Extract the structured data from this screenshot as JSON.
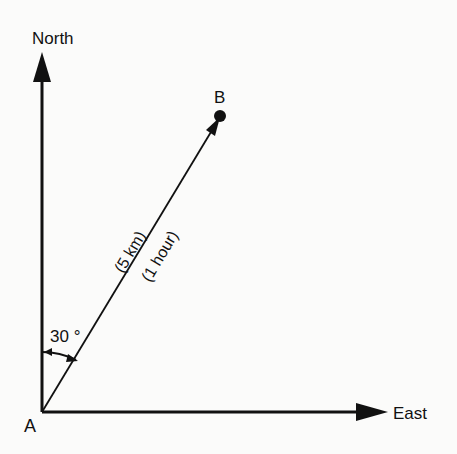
{
  "diagram": {
    "type": "vector-bearing",
    "axes": {
      "north_label": "North",
      "east_label": "East"
    },
    "points": {
      "origin_label": "A",
      "destination_label": "B"
    },
    "vector": {
      "distance_label": "(5 km)",
      "time_label": "(1 hour)"
    },
    "angle": {
      "label": "30 °",
      "value_degrees": 30,
      "measured_from": "North"
    },
    "colors": {
      "ink": "#111111",
      "background": "#fbfbfa"
    }
  }
}
